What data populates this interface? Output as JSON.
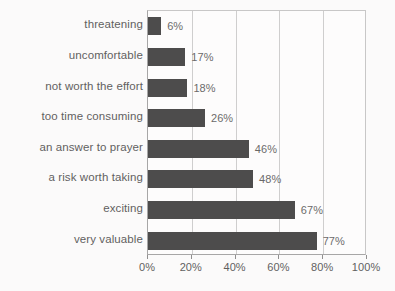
{
  "chart_data": {
    "type": "bar",
    "orientation": "horizontal",
    "title": "",
    "subtitle": "",
    "xlabel": "",
    "ylabel": "",
    "xlim": [
      0,
      100
    ],
    "grid": true,
    "legend": null,
    "legend_position": "none",
    "value_suffix": "%",
    "xticks": [
      "0%",
      "20%",
      "40%",
      "60%",
      "80%",
      "100%"
    ],
    "xtick_values": [
      0,
      20,
      40,
      60,
      80,
      100
    ],
    "categories": [
      "threatening",
      "uncomfortable",
      "not worth the effort",
      "too time consuming",
      "an answer to prayer",
      "a risk worth taking",
      "exciting",
      "very valuable"
    ],
    "values": [
      6,
      17,
      18,
      26,
      46,
      48,
      67,
      77
    ],
    "value_labels": [
      "6%",
      "17%",
      "18%",
      "26%",
      "46%",
      "48%",
      "67%",
      "77%"
    ],
    "bar_color": "#141414",
    "grid_color": "#c2c2c2",
    "axis_color": "#8d8d8d",
    "background_color": "#ffffff",
    "text_color": "#2c2c2c"
  }
}
